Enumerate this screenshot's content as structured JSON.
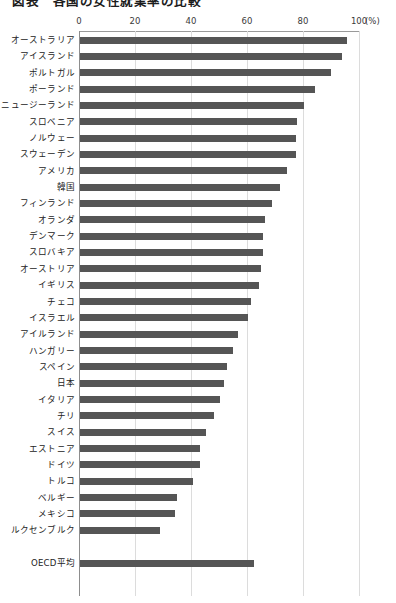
{
  "chart": {
    "title": "図表　各国の女性就業率の比較",
    "axis": {
      "tick_labels": [
        "0",
        "20",
        "40",
        "60",
        "80",
        "100"
      ],
      "unit_label": "(%)",
      "xmin": 0,
      "xmax": 100
    }
  },
  "chart_data": {
    "type": "bar",
    "orientation": "horizontal",
    "title": "図表　各国の女性就業率の比較",
    "xlabel": "(%)",
    "ylabel": "",
    "xlim": [
      0,
      100
    ],
    "grid": true,
    "legend": "none",
    "categories": [
      "オーストラリア",
      "アイスランド",
      "ポルトガル",
      "ポーランド",
      "ニュージーランド",
      "スロベニア",
      "ノルウェー",
      "スウェーデン",
      "アメリカ",
      "韓国",
      "フィンランド",
      "オランダ",
      "デンマーク",
      "スロバキア",
      "オーストリア",
      "イギリス",
      "チェコ",
      "イスラエル",
      "アイルランド",
      "ハンガリー",
      "スペイン",
      "日本",
      "イタリア",
      "チリ",
      "スイス",
      "エストニア",
      "ドイツ",
      "トルコ",
      "ベルギー",
      "メキシコ",
      "ルクセンブルク",
      "OECD平均"
    ],
    "values": [
      95.5,
      93.5,
      89.5,
      84.0,
      80.0,
      77.5,
      77.0,
      77.0,
      74.0,
      71.5,
      68.5,
      66.0,
      65.5,
      65.5,
      64.5,
      64.0,
      61.0,
      60.0,
      56.5,
      54.5,
      52.5,
      51.5,
      50.0,
      48.0,
      45.0,
      43.0,
      43.0,
      40.5,
      34.5,
      34.0,
      28.5,
      62.0
    ]
  },
  "style": {
    "bar_color": "#555555",
    "grid_color": "#dcdcdc",
    "axis_color": "#8d8d8d",
    "text_color": "#232323",
    "background": "#ffffff"
  }
}
